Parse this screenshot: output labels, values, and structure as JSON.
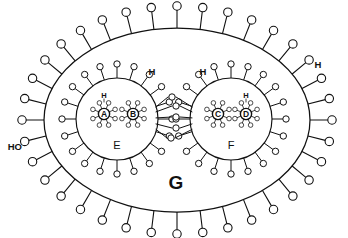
{
  "figure": {
    "background_color": "#ffffff",
    "stroke_color": "#111111",
    "width": 348,
    "height": 238
  },
  "labels": {
    "outer_region": "G",
    "left_inner_region": "E",
    "right_inner_region": "F",
    "atom_a": "A",
    "atom_b": "B",
    "atom_c": "C",
    "atom_d": "D",
    "hydroxyl_left": "HO",
    "hydrogen_right": "H",
    "hydrogen_top_left": "H",
    "hydrogen_top_right": "H",
    "hydrogen_on_a": "H",
    "hydrogen_on_d": "H"
  },
  "chart_data": {
    "type": "diagram",
    "shells": [
      {
        "name": "G",
        "label": "G",
        "label_x": 176,
        "label_y": 182,
        "cx": 177,
        "cy": 120,
        "rx": 133,
        "ry": 92,
        "spoke_count": 36,
        "spoke_length": 22,
        "node_radius": 4.2,
        "level": "outer"
      },
      {
        "name": "E",
        "label": "E",
        "label_x": 117,
        "label_y": 145,
        "cx": 117,
        "cy": 119,
        "rx": 41,
        "ry": 41,
        "spoke_count": 20,
        "spoke_length": 14,
        "node_radius": 3.2,
        "level": "inner"
      },
      {
        "name": "F",
        "label": "F",
        "label_x": 231,
        "label_y": 145,
        "cx": 231,
        "cy": 119,
        "rx": 41,
        "ry": 41,
        "spoke_count": 20,
        "spoke_length": 14,
        "node_radius": 3.2,
        "level": "inner"
      }
    ],
    "atoms": [
      {
        "name": "A",
        "label": "A",
        "cx": 104,
        "cy": 114,
        "core_radius": 5.6,
        "satellite_count": 8,
        "satellite_distance": 12,
        "satellite_radius": 2.3,
        "hydrogen_label": "H",
        "hydrogen_x": 104,
        "hydrogen_y": 95
      },
      {
        "name": "B",
        "label": "B",
        "cx": 133,
        "cy": 114,
        "core_radius": 5.6,
        "satellite_count": 8,
        "satellite_distance": 12,
        "satellite_radius": 2.3,
        "hydrogen_label": null,
        "hydrogen_x": null,
        "hydrogen_y": null
      },
      {
        "name": "C",
        "label": "C",
        "cx": 218,
        "cy": 114,
        "core_radius": 5.6,
        "satellite_count": 8,
        "satellite_distance": 12,
        "satellite_radius": 2.3,
        "hydrogen_label": null,
        "hydrogen_x": null,
        "hydrogen_y": null
      },
      {
        "name": "D",
        "label": "D",
        "cx": 246,
        "cy": 114,
        "core_radius": 5.6,
        "satellite_count": 8,
        "satellite_distance": 12,
        "satellite_radius": 2.3,
        "hydrogen_label": "H",
        "hydrogen_x": 246,
        "hydrogen_y": 95
      }
    ],
    "bridge_nodes": [
      {
        "x": 172,
        "y": 97
      },
      {
        "x": 176,
        "y": 106
      },
      {
        "x": 176,
        "y": 117
      },
      {
        "x": 176,
        "y": 128
      },
      {
        "x": 171,
        "y": 138
      }
    ],
    "annotations": [
      {
        "text": "HO",
        "x": 22,
        "y": 146,
        "anchor": "end",
        "kind": "hydroxyl"
      },
      {
        "text": "H",
        "x": 318,
        "y": 64,
        "anchor": "middle",
        "kind": "hydrogen"
      },
      {
        "text": "H",
        "x": 152,
        "y": 71,
        "anchor": "middle",
        "kind": "hydrogen"
      },
      {
        "text": "H",
        "x": 203,
        "y": 71,
        "anchor": "middle",
        "kind": "hydrogen"
      }
    ]
  }
}
